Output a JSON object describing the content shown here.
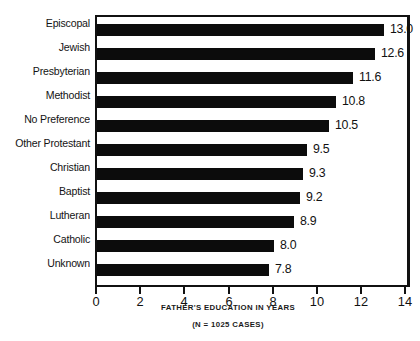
{
  "chart_data": {
    "type": "bar",
    "orientation": "horizontal",
    "title": "",
    "xlabel": "FATHER'S EDUCATION IN YEARS",
    "ylabel": "",
    "note": "(N = 1025 CASES)",
    "xlim": [
      0,
      14.25
    ],
    "xticks": [
      0,
      2,
      4,
      6,
      8,
      10,
      12,
      14
    ],
    "xtick_labels": [
      "0",
      "2",
      "4",
      "6",
      "8",
      "10",
      "12",
      "14"
    ],
    "grid": false,
    "legend": null,
    "bar_color": "#0c0c0c",
    "frame_color": "#111111",
    "categories": [
      "Episcopal",
      "Jewish",
      "Presbyterian",
      "Methodist",
      "No Preference",
      "Other Protestant",
      "Christian",
      "Baptist",
      "Lutheran",
      "Catholic",
      "Unknown"
    ],
    "values": [
      13.0,
      12.6,
      11.6,
      10.8,
      10.5,
      9.5,
      9.3,
      9.2,
      8.9,
      8.0,
      7.8
    ],
    "value_labels": [
      "13.0",
      "12.6",
      "11.6",
      "10.8",
      "10.5",
      "9.5",
      "9.3",
      "9.2",
      "8.9",
      "8.0",
      "7.8"
    ]
  }
}
